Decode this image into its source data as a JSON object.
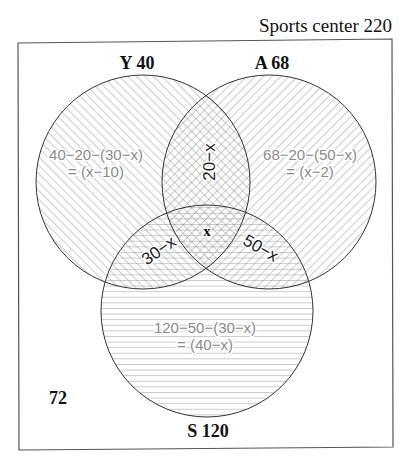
{
  "title": "Sports center 220",
  "sets": {
    "Y": {
      "label": "Y 40"
    },
    "A": {
      "label": "A 68"
    },
    "S": {
      "label": "S 120"
    }
  },
  "outside": {
    "label": "72"
  },
  "regions": {
    "y_only": {
      "line1": "40−20−(30−x)",
      "line2": "= (x−10)"
    },
    "a_only": {
      "line1": "68−20−(50−x)",
      "line2": "= (x−2)"
    },
    "s_only": {
      "line1": "120−50−(30−x)",
      "line2": "= (40−x)"
    },
    "y_and_a": {
      "label": "20−x"
    },
    "y_and_s": {
      "label": "30−x"
    },
    "a_and_s": {
      "label": "50−x"
    },
    "all_three": {
      "label": "x"
    }
  },
  "colors": {
    "outline": "#333333",
    "hatch": "#8c8c8c",
    "region_text": "#8a8a8a"
  }
}
